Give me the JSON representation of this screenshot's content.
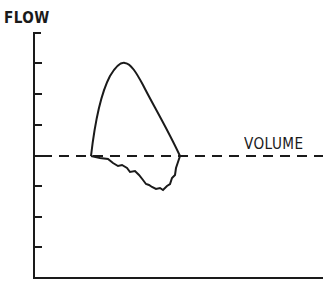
{
  "diagram": {
    "title": "",
    "y_axis_label": "FLOW",
    "x_axis_label": "VOLUME",
    "y_ticks": 9,
    "x_ticks": 0,
    "baseline": "dashed zero-flow line at 5th tick from top",
    "curve": "flow-volume loop: smooth upper (expiratory) limb peaking near 2nd tick, irregular lower (inspiratory) limb dipping to ~1 tick below baseline",
    "colors": {
      "ink": "#1a1a1a",
      "background": "#ffffff"
    }
  }
}
